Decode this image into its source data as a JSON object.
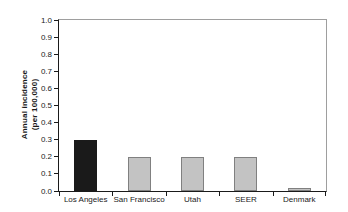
{
  "figure": {
    "background": "#ffffff"
  },
  "chart_data": {
    "type": "bar",
    "title": "",
    "categories": [
      "Los Angeles",
      "San Francisco",
      "Utah",
      "SEER",
      "Denmark"
    ],
    "values": [
      0.3,
      0.2,
      0.2,
      0.2,
      0.02
    ],
    "bar_fill_colors": [
      "#1a1a1a",
      "#c3c3c3",
      "#c3c3c3",
      "#c3c3c3",
      "#c3c3c3"
    ],
    "bar_border_colors": [
      "#1a1a1a",
      "#808080",
      "#808080",
      "#808080",
      "#808080"
    ],
    "xlabel": "",
    "ylabel_line1": "Annual incidence",
    "ylabel_line2": "(per 100,000)",
    "ylim": [
      0.0,
      1.0
    ],
    "ytick_labels": [
      "0.0",
      "0.1",
      "0.2",
      "0.3",
      "0.4",
      "0.5",
      "0.6",
      "0.7",
      "0.8",
      "0.9",
      "1.0"
    ],
    "grid": false,
    "legend": "none",
    "axis_color": "#1a1a1a",
    "frame_color": "#9e9e9e"
  }
}
